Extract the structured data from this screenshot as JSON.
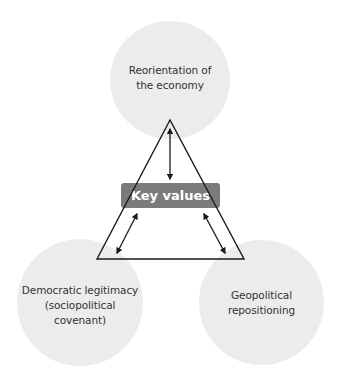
{
  "diagram": {
    "nodes": [
      {
        "id": "top",
        "label": "Reorientation of the economy",
        "lines": [
          "Reorientation of",
          "the economy"
        ]
      },
      {
        "id": "left",
        "label": "Democratic legitimacy (sociopolitical covenant)",
        "lines": [
          "Democratic legitimacy",
          "(sociopolitical",
          "covenant)"
        ]
      },
      {
        "id": "right",
        "label": "Geopolitical repositioning",
        "lines": [
          "Geopolitical",
          "repositioning"
        ]
      }
    ],
    "center": {
      "label": "Key values"
    },
    "edges": [
      {
        "from": "center",
        "to": "top",
        "type": "bidirectional-arrow"
      },
      {
        "from": "center",
        "to": "left",
        "type": "bidirectional-arrow"
      },
      {
        "from": "center",
        "to": "right",
        "type": "bidirectional-arrow"
      }
    ],
    "colors": {
      "circle_fill": "#ececec",
      "key_box_fill": "#7b7b7b",
      "line": "#1a1a1a",
      "text": "#333333"
    }
  }
}
